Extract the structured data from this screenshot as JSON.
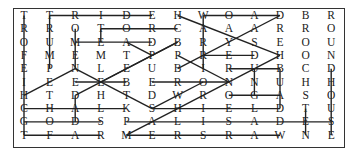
{
  "puzzle": {
    "type": "word-search",
    "rows": 10,
    "cols": 13,
    "grid": [
      [
        "T",
        "T",
        "R",
        "I",
        "D",
        "E",
        "H",
        "W",
        "O",
        "A",
        "D",
        "B",
        "R"
      ],
      [
        "R",
        "R",
        "O",
        "T",
        "O",
        "R",
        "C",
        "A",
        "A",
        "A",
        "R",
        "R",
        "O"
      ],
      [
        "O",
        "U",
        "M",
        "E",
        "A",
        "D",
        "B",
        "R",
        "Y",
        "S",
        "E",
        "O",
        "U"
      ],
      [
        "F",
        "M",
        "E",
        "M",
        "T",
        "P",
        "P",
        "R",
        "E",
        "D",
        "H",
        "O",
        "N"
      ],
      [
        "E",
        "P",
        "N",
        "L",
        "E",
        "U",
        "B",
        "I",
        "R",
        "U",
        "B",
        "C",
        "D"
      ],
      [
        "I",
        "E",
        "E",
        "E",
        "B",
        "E",
        "R",
        "O",
        "N",
        "N",
        "U",
        "H",
        "H"
      ],
      [
        "H",
        "T",
        "D",
        "H",
        "T",
        "D",
        "W",
        "R",
        "O",
        "G",
        "A",
        "S",
        "O"
      ],
      [
        "C",
        "H",
        "A",
        "L",
        "K",
        "S",
        "H",
        "I",
        "E",
        "L",
        "D",
        "T",
        "U"
      ],
      [
        "G",
        "O",
        "D",
        "S",
        "P",
        "A",
        "L",
        "I",
        "S",
        "A",
        "D",
        "E",
        "S"
      ],
      [
        "T",
        "F",
        "A",
        "R",
        "M",
        "E",
        "R",
        "S",
        "R",
        "A",
        "W",
        "N",
        "E"
      ]
    ],
    "found_lines": [
      {
        "from": [
          0,
          1
        ],
        "to": [
          0,
          5
        ]
      },
      {
        "from": [
          0,
          7
        ],
        "to": [
          0,
          10
        ]
      },
      {
        "from": [
          1,
          3
        ],
        "to": [
          1,
          6
        ]
      },
      {
        "from": [
          2,
          2
        ],
        "to": [
          2,
          5
        ]
      },
      {
        "from": [
          3,
          7
        ],
        "to": [
          3,
          9
        ]
      },
      {
        "from": [
          4,
          8
        ],
        "to": [
          4,
          10
        ]
      },
      {
        "from": [
          5,
          2
        ],
        "to": [
          5,
          4
        ]
      },
      {
        "from": [
          5,
          5
        ],
        "to": [
          5,
          8
        ]
      },
      {
        "from": [
          6,
          8
        ],
        "to": [
          6,
          10
        ]
      },
      {
        "from": [
          7,
          0
        ],
        "to": [
          7,
          4
        ]
      },
      {
        "from": [
          7,
          5
        ],
        "to": [
          7,
          10
        ]
      },
      {
        "from": [
          8,
          0
        ],
        "to": [
          8,
          3
        ]
      },
      {
        "from": [
          8,
          4
        ],
        "to": [
          8,
          12
        ]
      },
      {
        "from": [
          9,
          0
        ],
        "to": [
          9,
          3
        ]
      },
      {
        "from": [
          9,
          4
        ],
        "to": [
          9,
          10
        ]
      },
      {
        "from": [
          0,
          0
        ],
        "to": [
          9,
          0
        ]
      },
      {
        "from": [
          0,
          1
        ],
        "to": [
          4,
          1
        ]
      },
      {
        "from": [
          1,
          2
        ],
        "to": [
          4,
          2
        ]
      },
      {
        "from": [
          1,
          3
        ],
        "to": [
          2,
          3
        ]
      },
      {
        "from": [
          6,
          2
        ],
        "to": [
          8,
          2
        ]
      },
      {
        "from": [
          4,
          12
        ],
        "to": [
          9,
          12
        ]
      },
      {
        "from": [
          7,
          11
        ],
        "to": [
          9,
          11
        ]
      },
      {
        "from": [
          0,
          7
        ],
        "to": [
          4,
          7
        ]
      },
      {
        "from": [
          4,
          9
        ],
        "to": [
          6,
          9
        ]
      },
      {
        "from": [
          4,
          10
        ],
        "to": [
          7,
          10
        ]
      },
      {
        "from": [
          2,
          4
        ],
        "to": [
          3,
          5
        ]
      },
      {
        "from": [
          0,
          6
        ],
        "to": [
          3,
          10
        ]
      },
      {
        "from": [
          0,
          10
        ],
        "to": [
          4,
          6
        ]
      },
      {
        "from": [
          2,
          6
        ],
        "to": [
          6,
          2
        ]
      },
      {
        "from": [
          4,
          2
        ],
        "to": [
          7,
          5
        ]
      },
      {
        "from": [
          6,
          0
        ],
        "to": [
          4,
          2
        ]
      },
      {
        "from": [
          3,
          6
        ],
        "to": [
          5,
          8
        ]
      },
      {
        "from": [
          5,
          3
        ],
        "to": [
          2,
          6
        ]
      },
      {
        "from": [
          7,
          5
        ],
        "to": [
          5,
          7
        ]
      },
      {
        "from": [
          9,
          4
        ],
        "to": [
          7,
          6
        ]
      },
      {
        "from": [
          7,
          6
        ],
        "to": [
          3,
          10
        ]
      }
    ]
  },
  "colors": {
    "text": "#222222",
    "line": "#222222",
    "border": "#333333"
  }
}
